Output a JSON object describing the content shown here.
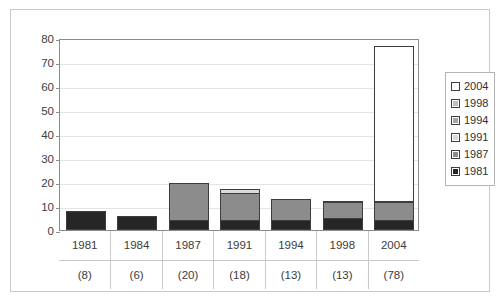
{
  "caption_clipped": "· ·",
  "chart_data": {
    "type": "bar",
    "subtype": "stacked",
    "title": "",
    "xlabel": "",
    "ylabel": "",
    "ylim": [
      0,
      80
    ],
    "yticks": [
      0,
      10,
      20,
      30,
      40,
      50,
      60,
      70,
      80
    ],
    "ytick_labels": [
      "0",
      "10",
      "20",
      "30",
      "40",
      "50",
      "60",
      "70",
      "80"
    ],
    "grid": true,
    "grid_axis": "y",
    "legend_position": "right",
    "categories": [
      "1981",
      "1984",
      "1987",
      "1991",
      "1994",
      "1998",
      "2004"
    ],
    "category_sublabels": [
      "(8)",
      "(6)",
      "(20)",
      "(18)",
      "(13)",
      "(13)",
      "(78)"
    ],
    "category_totals": [
      8,
      6,
      20,
      18,
      13,
      13,
      78
    ],
    "series": [
      {
        "name": "1981",
        "color": "#262626",
        "values": [
          8,
          6,
          4,
          4,
          4,
          5,
          4
        ]
      },
      {
        "name": "1987",
        "color": "#8c8c8c",
        "values": [
          0,
          0,
          16,
          12,
          9.5,
          7,
          8
        ]
      },
      {
        "name": "1991",
        "color": "#d9d9d9",
        "values": [
          0,
          0,
          0,
          2,
          0,
          1,
          1
        ]
      },
      {
        "name": "1994",
        "color": "#a6a6a6",
        "values": [
          0,
          0,
          0,
          0,
          0,
          0,
          0
        ]
      },
      {
        "name": "1998",
        "color": "#bfbfbf",
        "values": [
          0,
          0,
          0,
          0,
          0,
          0,
          0
        ]
      },
      {
        "name": "2004",
        "color": "#ffffff",
        "values": [
          0,
          0,
          0,
          0,
          0,
          0,
          65
        ]
      }
    ]
  },
  "legend": {
    "entries": [
      {
        "label": "2004",
        "color": "#ffffff"
      },
      {
        "label": "1998",
        "color": "#bfbfbf"
      },
      {
        "label": "1994",
        "color": "#a6a6a6"
      },
      {
        "label": "1991",
        "color": "#d9d9d9"
      },
      {
        "label": "1987",
        "color": "#8c8c8c"
      },
      {
        "label": "1981",
        "color": "#262626"
      }
    ]
  },
  "colors": {
    "plot_border": "#8c8c8c",
    "frame_border": "#c9c9c9",
    "gridline": "#e4e4e4",
    "bar_outline": "#3d3d3d",
    "text": "#3a3a3a"
  }
}
